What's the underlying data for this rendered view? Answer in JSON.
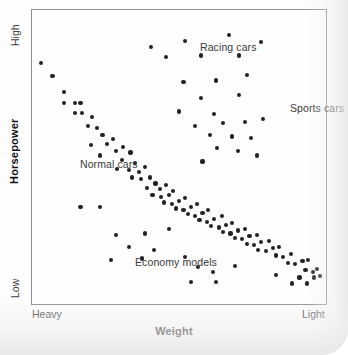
{
  "chart_data": {
    "type": "scatter",
    "title": "",
    "xlabel": "Weight",
    "ylabel": "Horsepower",
    "grid": false,
    "legend": "none",
    "x_axis": {
      "label": "Weight",
      "tick_labels": [
        "Heavy",
        "Light"
      ],
      "direction": "heavy-to-light (decreasing weight left to right)",
      "xlim": [
        0,
        100
      ]
    },
    "y_axis": {
      "label": "Horsepower",
      "tick_labels": [
        "Low",
        "High"
      ],
      "direction": "low-at-bottom to high-at-top",
      "ylim": [
        0,
        100
      ]
    },
    "annotations": [
      {
        "text": "Racing cars",
        "x": 47.0,
        "y": 91.0
      },
      {
        "text": "Sports cars",
        "x": 78.0,
        "y": 70.5
      },
      {
        "text": "Normal cars",
        "x": 7.5,
        "y": 51.5
      },
      {
        "text": "Economy models",
        "x": 26.5,
        "y": 19.5
      }
    ],
    "series": [
      {
        "name": "Normal cars",
        "description": "Dense downward-sloping band from heavy/high-power to light/low-power",
        "points": [
          [
            3.0,
            82.0
          ],
          [
            7.0,
            77.5
          ],
          [
            11.0,
            72.0
          ],
          [
            11.0,
            68.5
          ],
          [
            14.5,
            68.5
          ],
          [
            16.5,
            68.5
          ],
          [
            14.5,
            65.0
          ],
          [
            17.0,
            65.0
          ],
          [
            20.5,
            63.5
          ],
          [
            19.0,
            60.5
          ],
          [
            22.0,
            60.0
          ],
          [
            24.0,
            57.5
          ],
          [
            20.0,
            54.0
          ],
          [
            25.5,
            54.5
          ],
          [
            27.5,
            56.0
          ],
          [
            23.0,
            50.5
          ],
          [
            28.5,
            52.0
          ],
          [
            31.0,
            53.5
          ],
          [
            33.5,
            51.5
          ],
          [
            30.5,
            49.0
          ],
          [
            35.0,
            48.0
          ],
          [
            29.0,
            46.0
          ],
          [
            33.0,
            45.5
          ],
          [
            36.5,
            45.0
          ],
          [
            38.5,
            46.5
          ],
          [
            34.0,
            43.0
          ],
          [
            37.0,
            42.5
          ],
          [
            40.0,
            43.0
          ],
          [
            42.0,
            41.0
          ],
          [
            39.0,
            39.5
          ],
          [
            43.5,
            39.0
          ],
          [
            45.5,
            40.5
          ],
          [
            41.0,
            37.0
          ],
          [
            44.0,
            36.5
          ],
          [
            46.5,
            37.0
          ],
          [
            48.0,
            38.5
          ],
          [
            45.0,
            34.5
          ],
          [
            47.5,
            34.0
          ],
          [
            50.0,
            35.0
          ],
          [
            52.0,
            36.0
          ],
          [
            49.0,
            32.5
          ],
          [
            51.5,
            32.0
          ],
          [
            54.0,
            33.0
          ],
          [
            56.0,
            34.0
          ],
          [
            53.0,
            30.5
          ],
          [
            55.5,
            30.0
          ],
          [
            58.0,
            31.0
          ],
          [
            60.0,
            32.0
          ],
          [
            57.0,
            28.5
          ],
          [
            59.5,
            28.0
          ],
          [
            62.0,
            29.0
          ],
          [
            64.5,
            30.0
          ],
          [
            61.0,
            26.5
          ],
          [
            63.5,
            26.0
          ],
          [
            66.0,
            27.0
          ],
          [
            68.0,
            27.5
          ],
          [
            65.0,
            24.5
          ],
          [
            67.5,
            24.0
          ],
          [
            70.0,
            25.0
          ],
          [
            72.5,
            25.5
          ],
          [
            69.0,
            22.5
          ],
          [
            71.5,
            22.0
          ],
          [
            74.0,
            23.0
          ],
          [
            76.5,
            23.5
          ],
          [
            73.0,
            20.5
          ],
          [
            75.5,
            20.0
          ],
          [
            78.0,
            21.0
          ],
          [
            80.5,
            21.5
          ],
          [
            77.0,
            18.5
          ],
          [
            79.5,
            18.0
          ],
          [
            82.0,
            19.0
          ],
          [
            84.0,
            19.5
          ],
          [
            83.0,
            16.5
          ],
          [
            85.5,
            16.0
          ],
          [
            88.0,
            17.0
          ],
          [
            87.0,
            14.0
          ],
          [
            89.5,
            13.5
          ],
          [
            92.0,
            14.5
          ],
          [
            94.0,
            15.0
          ],
          [
            93.0,
            11.5
          ],
          [
            95.5,
            11.0
          ],
          [
            97.0,
            12.0
          ],
          [
            96.0,
            9.0
          ],
          [
            98.0,
            9.5
          ],
          [
            91.0,
            9.0
          ]
        ]
      },
      {
        "name": "Racing cars",
        "description": "High horsepower cluster across mid-to-light weights",
        "points": [
          [
            40.5,
            87.5
          ],
          [
            52.0,
            89.5
          ],
          [
            67.0,
            91.5
          ],
          [
            78.0,
            89.0
          ],
          [
            45.5,
            84.0
          ],
          [
            57.5,
            84.5
          ],
          [
            70.5,
            84.5
          ],
          [
            51.5,
            75.5
          ],
          [
            62.5,
            76.0
          ],
          [
            73.0,
            78.0
          ]
        ]
      },
      {
        "name": "Sports cars",
        "description": "Upper-right cluster, light weight with high horsepower",
        "points": [
          [
            57.5,
            70.0
          ],
          [
            70.5,
            71.0
          ],
          [
            50.0,
            65.5
          ],
          [
            62.0,
            64.5
          ],
          [
            55.5,
            60.5
          ],
          [
            65.0,
            61.5
          ],
          [
            72.5,
            62.0
          ],
          [
            78.5,
            63.0
          ],
          [
            60.5,
            57.5
          ],
          [
            68.0,
            57.0
          ],
          [
            74.5,
            56.5
          ],
          [
            63.0,
            53.0
          ],
          [
            70.0,
            52.0
          ],
          [
            76.5,
            50.5
          ],
          [
            58.0,
            48.5
          ]
        ]
      },
      {
        "name": "Economy models",
        "description": "Sparse low-horsepower outliers below the main band",
        "points": [
          [
            16.5,
            33.0
          ],
          [
            23.0,
            33.0
          ],
          [
            28.5,
            23.5
          ],
          [
            38.5,
            24.0
          ],
          [
            46.5,
            25.5
          ],
          [
            33.0,
            19.5
          ],
          [
            41.5,
            18.5
          ],
          [
            27.0,
            15.0
          ],
          [
            37.5,
            15.5
          ],
          [
            52.0,
            16.0
          ],
          [
            56.5,
            12.5
          ],
          [
            61.5,
            11.0
          ],
          [
            54.0,
            7.5
          ],
          [
            62.5,
            7.5
          ],
          [
            69.0,
            13.0
          ],
          [
            83.0,
            10.0
          ],
          [
            88.5,
            7.0
          ],
          [
            93.5,
            7.0
          ]
        ]
      }
    ]
  }
}
